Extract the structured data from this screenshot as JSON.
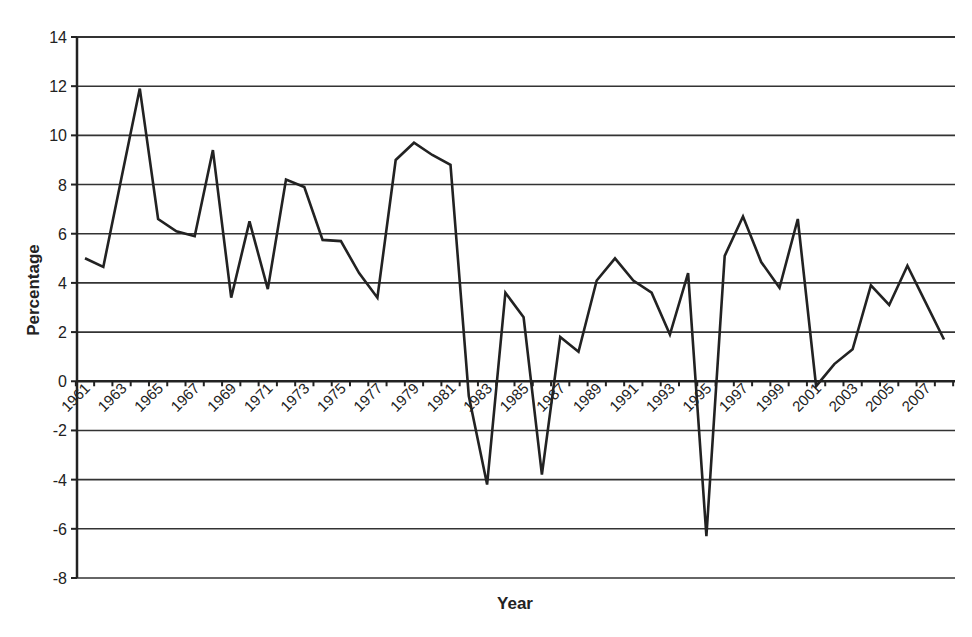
{
  "chart_data": {
    "type": "line",
    "title": "",
    "xlabel": "Year",
    "ylabel": "Percentage",
    "ylim": [
      -8,
      14
    ],
    "yticks": [
      14,
      12,
      10,
      8,
      6,
      4,
      2,
      0,
      -2,
      -4,
      -6,
      -8
    ],
    "grid": true,
    "legend": null,
    "x_tick_labels": [
      "1961",
      "1963",
      "1965",
      "1967",
      "1969",
      "1971",
      "1973",
      "1975",
      "1977",
      "1979",
      "1981",
      "1983",
      "1985",
      "1987",
      "1989",
      "1991",
      "1993",
      "1995",
      "1997",
      "1999",
      "2001",
      "2003",
      "2005",
      "2007"
    ],
    "x": [
      1961,
      1962,
      1963,
      1964,
      1965,
      1966,
      1967,
      1968,
      1969,
      1970,
      1971,
      1972,
      1973,
      1974,
      1975,
      1976,
      1977,
      1978,
      1979,
      1980,
      1981,
      1982,
      1983,
      1984,
      1985,
      1986,
      1987,
      1988,
      1989,
      1990,
      1991,
      1992,
      1993,
      1994,
      1995,
      1996,
      1997,
      1998,
      1999,
      2000,
      2001,
      2002,
      2003,
      2004,
      2005,
      2006,
      2007,
      2008
    ],
    "series": [
      {
        "name": "Percentage",
        "color": "#222222",
        "values": [
          5.0,
          4.65,
          8.3,
          11.9,
          6.6,
          6.1,
          5.9,
          9.4,
          3.4,
          6.5,
          3.75,
          8.2,
          7.9,
          5.75,
          5.7,
          4.4,
          3.4,
          9.0,
          9.7,
          9.2,
          8.8,
          -0.6,
          -4.2,
          3.6,
          2.6,
          -3.8,
          1.8,
          1.2,
          4.1,
          5.0,
          4.1,
          3.6,
          1.9,
          4.4,
          -6.3,
          5.1,
          6.7,
          4.85,
          3.8,
          6.6,
          -0.2,
          0.7,
          1.3,
          3.9,
          3.1,
          4.7,
          3.2,
          1.7
        ]
      }
    ]
  }
}
